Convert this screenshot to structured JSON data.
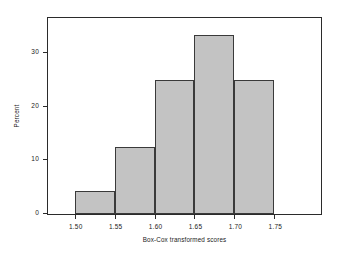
{
  "chart_data": {
    "type": "bar",
    "title": "",
    "subtitle": "",
    "xlabel": "Box-Cox transformed scores",
    "ylabel": "Percent",
    "grid": false,
    "legend": null,
    "legend_position": "none",
    "bin_width": 0.05,
    "bin_edges": [
      1.5,
      1.55,
      1.6,
      1.65,
      1.7,
      1.75
    ],
    "categories": [
      "1.50-1.55",
      "1.55-1.60",
      "1.60-1.65",
      "1.65-1.70",
      "1.70-1.75"
    ],
    "values": [
      4.2,
      12.5,
      25.0,
      33.3,
      25.0
    ],
    "xlim": [
      1.4665,
      1.8085
    ],
    "ylim": [
      0,
      36.5
    ],
    "xticks": [
      1.5,
      1.55,
      1.6,
      1.65,
      1.7,
      1.75
    ],
    "xtick_labels": [
      "1.50",
      "1.55",
      "1.60",
      "1.65",
      "1.70",
      "1.75"
    ],
    "yticks": [
      0,
      10,
      20,
      30
    ],
    "ytick_labels": [
      "0",
      "10",
      "20",
      "30"
    ],
    "bar_fill_color": "#c3c3c3",
    "bar_edge_color": "#3a3a3a",
    "axis_color": "#2b2b2b",
    "background_color": "#ffffff"
  }
}
